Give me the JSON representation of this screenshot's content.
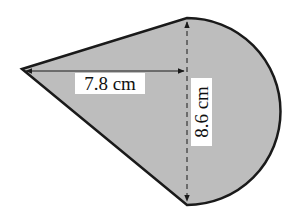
{
  "diagram": {
    "type": "composite-shape",
    "fill_color": "#bdbdbd",
    "stroke_color": "#1a1a1a",
    "labels": {
      "horizontal": "7.8 cm",
      "vertical": "8.6 cm"
    },
    "measurements": {
      "triangle_height": "7.8 cm",
      "diameter": "8.6 cm"
    }
  }
}
